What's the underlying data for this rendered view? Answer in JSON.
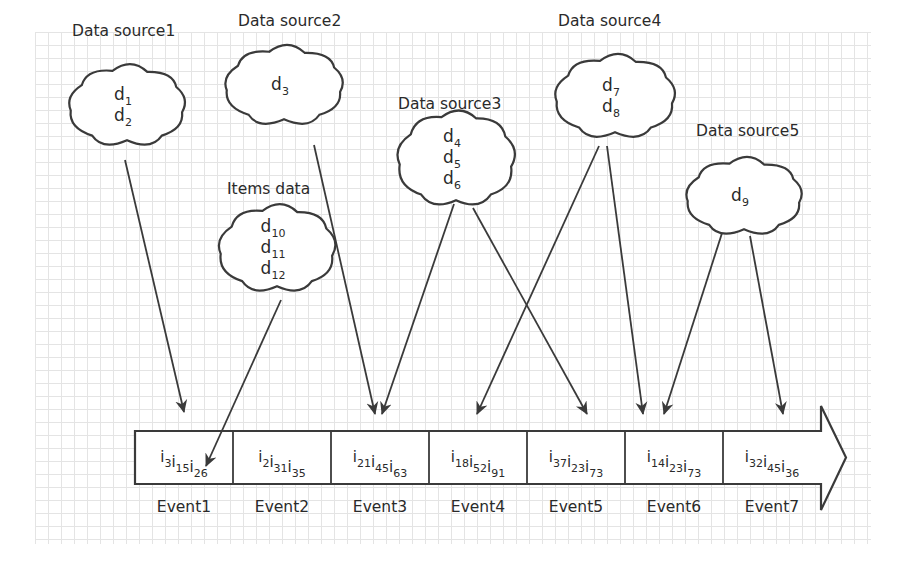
{
  "diagram": {
    "type": "data-sources-to-events",
    "colors": {
      "stroke": "#3a3a3a",
      "text": "#2a2a2a",
      "grid": "#e4e4e4",
      "background": "#ffffff"
    },
    "sources": [
      {
        "id": "ds1",
        "label": "Data source1",
        "items": [
          {
            "base": "d",
            "sub": "1"
          },
          {
            "base": "d",
            "sub": "2"
          }
        ],
        "label_pos": [
          72,
          36
        ],
        "cloud": {
          "cx": 127,
          "cy": 105,
          "w": 116,
          "h": 72
        }
      },
      {
        "id": "ds2",
        "label": "Data source2",
        "items": [
          {
            "base": "d",
            "sub": "3"
          }
        ],
        "label_pos": [
          238,
          26
        ],
        "cloud": {
          "cx": 284,
          "cy": 85,
          "w": 118,
          "h": 70
        }
      },
      {
        "id": "ds3",
        "label": "Data source3",
        "items": [
          {
            "base": "d",
            "sub": "4"
          },
          {
            "base": "d",
            "sub": "5"
          },
          {
            "base": "d",
            "sub": "6"
          }
        ],
        "label_pos": [
          398,
          109
        ],
        "cloud": {
          "cx": 456,
          "cy": 158,
          "w": 116,
          "h": 86
        }
      },
      {
        "id": "ds4",
        "label": "Data source4",
        "items": [
          {
            "base": "d",
            "sub": "7"
          },
          {
            "base": "d",
            "sub": "8"
          }
        ],
        "label_pos": [
          558,
          26
        ],
        "cloud": {
          "cx": 615,
          "cy": 96,
          "w": 120,
          "h": 74
        }
      },
      {
        "id": "ds5",
        "label": "Data source5",
        "items": [
          {
            "base": "d",
            "sub": "9"
          }
        ],
        "label_pos": [
          696,
          136
        ],
        "cloud": {
          "cx": 744,
          "cy": 196,
          "w": 116,
          "h": 68
        }
      },
      {
        "id": "items",
        "label": "Items data",
        "items": [
          {
            "base": "d",
            "sub": "10"
          },
          {
            "base": "d",
            "sub": "11"
          },
          {
            "base": "d",
            "sub": "12"
          }
        ],
        "label_pos": [
          227,
          194
        ],
        "cloud": {
          "cx": 277,
          "cy": 248,
          "w": 116,
          "h": 78
        }
      }
    ],
    "events": [
      {
        "label": "Event1",
        "items": [
          {
            "base": "i",
            "sub": "3"
          },
          {
            "base": "i",
            "sub": "15"
          },
          {
            "base": "i",
            "sub": "26"
          }
        ]
      },
      {
        "label": "Event2",
        "items": [
          {
            "base": "i",
            "sub": "2"
          },
          {
            "base": "i",
            "sub": "31"
          },
          {
            "base": "i",
            "sub": "35"
          }
        ]
      },
      {
        "label": "Event3",
        "items": [
          {
            "base": "i",
            "sub": "21"
          },
          {
            "base": "i",
            "sub": "45"
          },
          {
            "base": "i",
            "sub": "63"
          }
        ]
      },
      {
        "label": "Event4",
        "items": [
          {
            "base": "i",
            "sub": "18"
          },
          {
            "base": "i",
            "sub": "52"
          },
          {
            "base": "i",
            "sub": "91"
          }
        ]
      },
      {
        "label": "Event5",
        "items": [
          {
            "base": "i",
            "sub": "37"
          },
          {
            "base": "i",
            "sub": "23"
          },
          {
            "base": "i",
            "sub": "73"
          }
        ]
      },
      {
        "label": "Event6",
        "items": [
          {
            "base": "i",
            "sub": "14"
          },
          {
            "base": "i",
            "sub": "23"
          },
          {
            "base": "i",
            "sub": "73"
          }
        ]
      },
      {
        "label": "Event7",
        "items": [
          {
            "base": "i",
            "sub": "32"
          },
          {
            "base": "i",
            "sub": "45"
          },
          {
            "base": "i",
            "sub": "36"
          }
        ]
      }
    ],
    "timeline": {
      "x0": 135,
      "y0": 431,
      "y1": 484,
      "cell_w": 98,
      "cells": 7,
      "arrow_tip_x": 846,
      "arrow_head_top": 406,
      "arrow_head_bottom": 510
    },
    "edges": [
      {
        "from": "ds1",
        "to": "Event1",
        "x1": 125,
        "y1": 160,
        "x2": 184,
        "y2": 412
      },
      {
        "from": "items",
        "to": "Event1",
        "x1": 281,
        "y1": 300,
        "x2": 206,
        "y2": 466
      },
      {
        "from": "ds2",
        "to": "Event3",
        "x1": 314,
        "y1": 145,
        "x2": 375,
        "y2": 414
      },
      {
        "from": "ds3",
        "to": "Event3",
        "x1": 454,
        "y1": 204,
        "x2": 382,
        "y2": 414
      },
      {
        "from": "ds4",
        "to": "Event4",
        "x1": 599,
        "y1": 146,
        "x2": 477,
        "y2": 414
      },
      {
        "from": "ds3",
        "to": "Event5",
        "x1": 473,
        "y1": 208,
        "x2": 587,
        "y2": 414
      },
      {
        "from": "ds4",
        "to": "Event6",
        "x1": 607,
        "y1": 146,
        "x2": 643,
        "y2": 414
      },
      {
        "from": "ds5",
        "to": "Event6",
        "x1": 723,
        "y1": 230,
        "x2": 664,
        "y2": 414
      },
      {
        "from": "ds5",
        "to": "Event7",
        "x1": 750,
        "y1": 236,
        "x2": 783,
        "y2": 414
      }
    ]
  }
}
